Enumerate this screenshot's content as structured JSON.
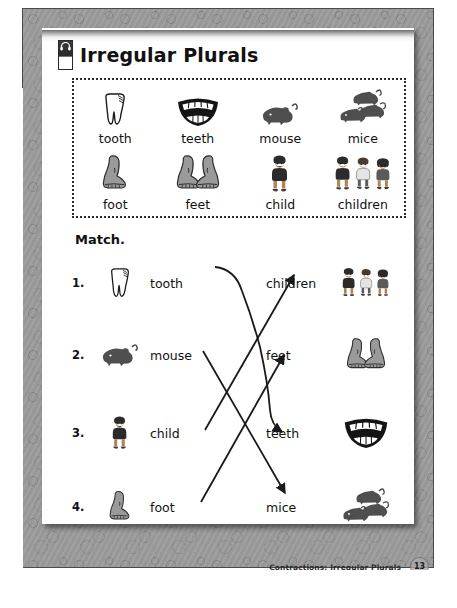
{
  "header": {
    "title": "Irregular Plurals",
    "icon": "headphones-icon"
  },
  "wordbank": {
    "rows": [
      [
        {
          "label": "tooth",
          "art": "tooth"
        },
        {
          "label": "teeth",
          "art": "teeth"
        },
        {
          "label": "mouse",
          "art": "mouse"
        },
        {
          "label": "mice",
          "art": "mice"
        }
      ],
      [
        {
          "label": "foot",
          "art": "foot"
        },
        {
          "label": "feet",
          "art": "feet"
        },
        {
          "label": "child",
          "art": "child"
        },
        {
          "label": "children",
          "art": "children"
        }
      ]
    ]
  },
  "instruction": "Match.",
  "match": {
    "left": [
      {
        "number": "1.",
        "word": "tooth",
        "art": "tooth"
      },
      {
        "number": "2.",
        "word": "mouse",
        "art": "mouse"
      },
      {
        "number": "3.",
        "word": "child",
        "art": "child"
      },
      {
        "number": "4.",
        "word": "foot",
        "art": "foot"
      }
    ],
    "right": [
      {
        "word": "children",
        "art": "children"
      },
      {
        "word": "feet",
        "art": "feet"
      },
      {
        "word": "teeth",
        "art": "teeth"
      },
      {
        "word": "mice",
        "art": "mice"
      }
    ],
    "connections": [
      {
        "from": "tooth",
        "to": "teeth"
      },
      {
        "from": "mouse",
        "to": "mice"
      },
      {
        "from": "child",
        "to": "children"
      },
      {
        "from": "foot",
        "to": "feet"
      }
    ]
  },
  "footer": {
    "text": "Contractions; Irregular Plurals",
    "page_number": "13"
  },
  "colors": {
    "border": "#4a4a4a",
    "texture": "#9b9b9b",
    "ink": "#111111",
    "art_gray": "#8e8e8e",
    "art_dark": "#3b3b3b"
  }
}
